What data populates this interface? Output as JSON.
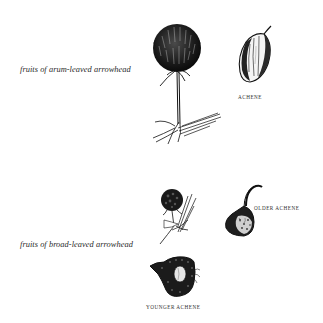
{
  "plate": {
    "background": "#ffffff",
    "ink_color": "#111111"
  },
  "sections": [
    {
      "caption": "fruits of arum-leaved arrowhead",
      "figures": [
        {
          "name": "fruit-head-on-stalk",
          "label": ""
        },
        {
          "name": "achene",
          "label": "ACHENE"
        }
      ]
    },
    {
      "caption": "fruits of broad-leaved arrowhead",
      "figures": [
        {
          "name": "fruit-head-on-stalk",
          "label": ""
        },
        {
          "name": "older-achene",
          "label": "OLDER ACHENE"
        },
        {
          "name": "younger-achene",
          "label": "YOUNGER ACHENE"
        }
      ]
    }
  ]
}
